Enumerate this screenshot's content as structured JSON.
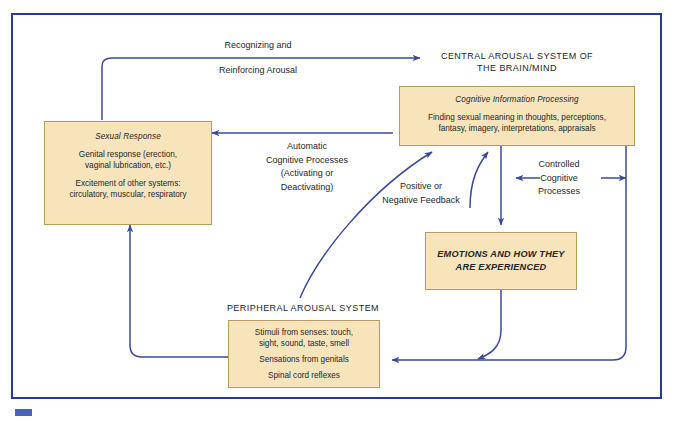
{
  "diagram": {
    "title_present": false,
    "frame_color": "#2a3b8f",
    "box_fill": "#f7e4bb",
    "box_border": "#b89a63",
    "arrow_color": "#3a4a96",
    "corner_mark_color": "#4a63b5"
  },
  "central": {
    "heading_line1": "CENTRAL AROUSAL SYSTEM OF",
    "heading_line2": "THE BRAIN/MIND",
    "cognitive_box": {
      "title": "Cognitive Information Processing",
      "body_line1": "Finding sexual meaning in thoughts, perceptions,",
      "body_line2": "fantasy, imagery, interpretations, appraisals"
    }
  },
  "sexual_response": {
    "title": "Sexual Response",
    "body_line1": "Genital response (erection,",
    "body_line2": "vaginal lubrication, etc.)",
    "body_line3": "Excitement of other systems:",
    "body_line4": "circulatory, muscular, respiratory"
  },
  "emotions": {
    "line1": "EMOTIONS AND HOW THEY",
    "line2": "ARE EXPERIENCED"
  },
  "peripheral": {
    "heading": "PERIPHERAL AROUSAL SYSTEM",
    "body_line1": "Stimuli from senses: touch,",
    "body_line2": "sight, sound, taste, smell",
    "body_line3": "Sensations from genitals",
    "body_line4": "Spinal cord reflexes"
  },
  "labels": {
    "recognizing": "Recognizing and",
    "reinforcing": "Reinforcing Arousal",
    "automatic_line1": "Automatic",
    "automatic_line2": "Cognitive Processes",
    "automatic_line3": "(Activating or",
    "automatic_line4": "Deactivating)",
    "feedback_line1": "Positive or",
    "feedback_line2": "Negative Feedback",
    "controlled_line1": "Controlled",
    "controlled_line2": "Cognitive",
    "controlled_line3": "Processes"
  }
}
